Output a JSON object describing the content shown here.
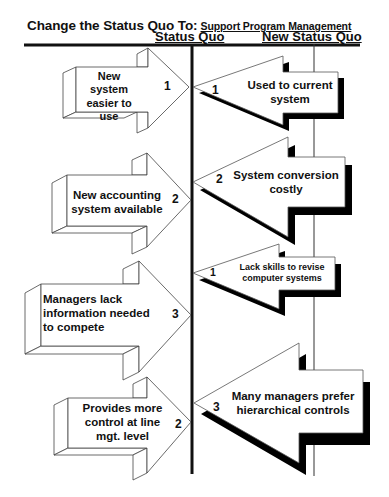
{
  "header": {
    "title": "Change the Status Quo To:",
    "subtitle": "Support Program Management",
    "columns": {
      "left": "Status Quo",
      "right": "New Status Quo"
    }
  },
  "colors": {
    "line": "#111111",
    "arrow_fill": "#ffffff",
    "shadow": "#000000",
    "stroke": "#555555"
  },
  "driving_forces": [
    {
      "label_lines": [
        "New system",
        "easier to use"
      ],
      "strength": "1"
    },
    {
      "label_lines": [
        "New accounting",
        "system available"
      ],
      "strength": "2"
    },
    {
      "label_lines": [
        "Managers lack",
        "information needed",
        "to compete"
      ],
      "strength": "3"
    },
    {
      "label_lines": [
        "Provides more",
        "control at line",
        "mgt. level"
      ],
      "strength": "2"
    }
  ],
  "restraining_forces": [
    {
      "label_lines": [
        "Used to current",
        "system"
      ],
      "strength": "1"
    },
    {
      "label_lines": [
        "System conversion",
        "costly"
      ],
      "strength": "2"
    },
    {
      "label_lines": [
        "Lack skills to revise",
        "computer systems"
      ],
      "strength": "1"
    },
    {
      "label_lines": [
        "Many managers prefer",
        "hierarchical controls"
      ],
      "strength": "3"
    }
  ]
}
